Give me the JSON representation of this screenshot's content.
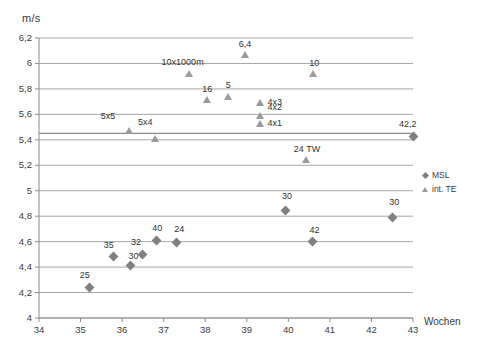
{
  "chart_data": {
    "type": "scatter",
    "title": "",
    "ylabel": "m/s",
    "xlabel": "Wochen",
    "xlim": [
      34,
      43
    ],
    "ylim": [
      4,
      6.2
    ],
    "xticks": [
      "34",
      "35",
      "36",
      "37",
      "38",
      "39",
      "40",
      "41",
      "42",
      "43"
    ],
    "yticks": [
      "4",
      "4,2",
      "4,4",
      "4,6",
      "4,8",
      "5",
      "5,2",
      "5,4",
      "5,6",
      "5,8",
      "6",
      "6,2"
    ],
    "grid": true,
    "legend_position": "right",
    "reference_line_y": 5.45,
    "series": [
      {
        "name": "MSL",
        "marker": "diamond",
        "color": "#808080",
        "points": [
          {
            "label": "25",
            "x": 35.22,
            "y": 4.24,
            "lx": -10,
            "ly": -17
          },
          {
            "label": "35",
            "x": 35.8,
            "y": 4.48,
            "lx": -10,
            "ly": -17
          },
          {
            "label": "30",
            "x": 36.2,
            "y": 4.41,
            "lx": -2,
            "ly": -15
          },
          {
            "label": "32",
            "x": 36.5,
            "y": 4.5,
            "lx": -12,
            "ly": -17
          },
          {
            "label": "40",
            "x": 36.82,
            "y": 4.61,
            "lx": -4,
            "ly": -17
          },
          {
            "label": "24",
            "x": 37.3,
            "y": 4.595,
            "lx": -2,
            "ly": -18
          },
          {
            "label": "30",
            "x": 39.92,
            "y": 4.845,
            "lx": -3,
            "ly": -19
          },
          {
            "label": "42",
            "x": 40.58,
            "y": 4.6,
            "lx": -3,
            "ly": -17
          },
          {
            "label": "30",
            "x": 42.5,
            "y": 4.79,
            "lx": -3,
            "ly": -20
          },
          {
            "label": "42,2",
            "x": 43.0,
            "y": 5.425,
            "lx": -14,
            "ly": -18
          }
        ]
      },
      {
        "name": "int. TE",
        "marker": "triangle",
        "color": "#9a9a9a",
        "points": [
          {
            "label": "5x5",
            "x": 36.16,
            "y": 5.47,
            "lx": -28,
            "ly": -20
          },
          {
            "label": "5x4",
            "x": 36.79,
            "y": 5.405,
            "lx": -17,
            "ly": -22
          },
          {
            "label": "10x1000m",
            "x": 37.6,
            "y": 5.92,
            "lx": -27,
            "ly": -17
          },
          {
            "label": "16",
            "x": 38.05,
            "y": 5.71,
            "lx": -5,
            "ly": -16
          },
          {
            "label": "5",
            "x": 38.54,
            "y": 5.735,
            "lx": -2,
            "ly": -17
          },
          {
            "label": "6,4",
            "x": 38.95,
            "y": 6.065,
            "lx": -6,
            "ly": -16
          },
          {
            "label": "4x3",
            "x": 39.33,
            "y": 5.69,
            "lx": 7,
            "ly": -6
          },
          {
            "label": "4x2",
            "x": 39.33,
            "y": 5.585,
            "lx": 7,
            "ly": -14
          },
          {
            "label": "4x1",
            "x": 39.33,
            "y": 5.525,
            "lx": 7,
            "ly": -6
          },
          {
            "label": "10",
            "x": 40.6,
            "y": 5.92,
            "lx": -4,
            "ly": -16
          },
          {
            "label": "24 TW",
            "x": 40.42,
            "y": 5.245,
            "lx": -12,
            "ly": -16
          }
        ]
      }
    ]
  },
  "legend": {
    "items": [
      {
        "label": "MSL",
        "marker": "diamond"
      },
      {
        "label": "int. TE",
        "marker": "triangle"
      }
    ]
  }
}
